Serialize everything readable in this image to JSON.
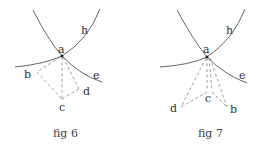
{
  "figures": [
    {
      "caption": "fig 6",
      "labels": {
        "a": "a",
        "b": "b",
        "c": "c",
        "d": "d",
        "e": "e",
        "h": "h"
      }
    },
    {
      "caption": "fig 7",
      "labels": {
        "a": "a",
        "b": "b",
        "c": "c",
        "d": "d",
        "e": "e",
        "h": "h"
      }
    }
  ],
  "colors": {
    "curve": "#555555",
    "dashed": "#888888",
    "text": "#333333"
  }
}
